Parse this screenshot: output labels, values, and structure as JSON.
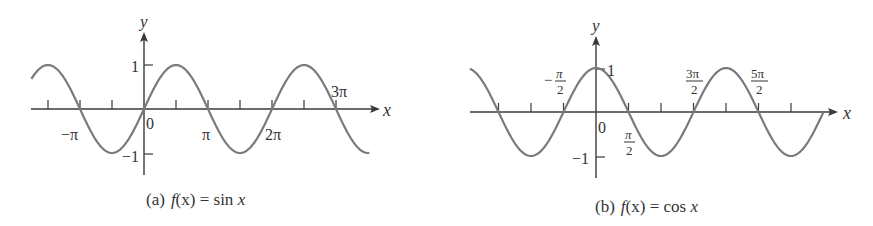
{
  "chart_data": [
    {
      "type": "line",
      "title": "(a) f(x) = sin x",
      "caption_prefix": "(a)",
      "caption_func": "f(x) = sin x",
      "function": "sin",
      "xlabel": "x",
      "ylabel": "y",
      "x_tick_labels": [
        "−π",
        "0",
        "π",
        "2π",
        "3π"
      ],
      "x_tick_positions_pi": [
        -1.5,
        -1,
        -0.5,
        0.5,
        1,
        1.5,
        2,
        2.5,
        3
      ],
      "y_tick_labels": [
        "1",
        "−1"
      ],
      "xlim_pi": [
        -1.76,
        3.52
      ],
      "ylim": [
        -1,
        1
      ],
      "grid": false,
      "series": [
        {
          "name": "sin x",
          "x_pi": [
            -1.5,
            -1,
            -0.5,
            0,
            0.5,
            1,
            1.5,
            2,
            2.5,
            3
          ],
          "values": [
            1,
            0,
            -1,
            0,
            1,
            0,
            -1,
            0,
            1,
            0
          ]
        }
      ]
    },
    {
      "type": "line",
      "title": "(b) f(x) = cos x",
      "caption_prefix": "(b)",
      "caption_func": "f(x) = cos x",
      "function": "cos",
      "xlabel": "x",
      "ylabel": "y",
      "x_tick_labels": [
        "−π/2",
        "0",
        "π/2",
        "3π/2",
        "5π/2"
      ],
      "x_tick_positions_pi": [
        -1.5,
        -1,
        -0.5,
        0.5,
        1,
        1.5,
        2,
        2.5,
        3
      ],
      "y_tick_labels": [
        "1",
        "−1"
      ],
      "xlim_pi": [
        -1.94,
        3.5
      ],
      "ylim": [
        -1,
        1
      ],
      "grid": false,
      "series": [
        {
          "name": "cos x",
          "x_pi": [
            -1.5,
            -1,
            -0.5,
            0,
            0.5,
            1,
            1.5,
            2,
            2.5,
            3,
            3.5
          ],
          "values": [
            0,
            -1,
            0,
            1,
            0,
            -1,
            0,
            1,
            0,
            -1,
            0
          ]
        }
      ]
    }
  ],
  "labels": {
    "a": {
      "y": "y",
      "x": "x",
      "one": "1",
      "neg_one": "−1",
      "zero": "0",
      "neg_pi": "−π",
      "pi": "π",
      "two_pi": "2π",
      "three_pi": "3π",
      "caption_prefix": "(a)",
      "caption_f": "f",
      "caption_paren": "(x)",
      "caption_eq": " = sin ",
      "caption_x": "x"
    },
    "b": {
      "y": "y",
      "x": "x",
      "one": "1",
      "neg_one": "−1",
      "zero": "0",
      "neg_sign": "−",
      "pi": "π",
      "two": "2",
      "three_pi": "3π",
      "five_pi": "5π",
      "caption_prefix": "(b)",
      "caption_f": "f",
      "caption_paren": "(x)",
      "caption_eq": " = cos ",
      "caption_x": "x"
    }
  },
  "colors": {
    "curve": "#7a7a7a",
    "axis": "#3a3a3a",
    "text": "#333333"
  }
}
